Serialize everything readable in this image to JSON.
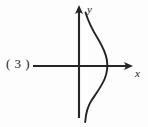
{
  "figure": {
    "number_label": "( 3 )",
    "background_color": "#fdfdfd",
    "ink_color": "#232323",
    "axes": {
      "x_label": "x",
      "y_label": "y",
      "origin": {
        "x": 79,
        "y": 66
      },
      "x_axis": {
        "start_x": 33,
        "end_x": 133,
        "y": 66,
        "arrow": "right"
      },
      "y_axis": {
        "x": 79,
        "start_y": 118,
        "end_y": 6,
        "arrow": "up"
      }
    }
  },
  "chart_data": {
    "type": "line",
    "title": "( 3 )",
    "xlabel": "x",
    "ylabel": "y",
    "grid": false,
    "legend": null,
    "annotations": [],
    "axis_ranges": {
      "xlim": [
        -3,
        4
      ],
      "ylim": [
        -4,
        4
      ]
    },
    "series": [
      {
        "name": "curve",
        "x": [
          0.22,
          0.35,
          0.55,
          0.8,
          1.05,
          1.3,
          1.5,
          1.62,
          1.68,
          1.66,
          1.55,
          1.38,
          1.15,
          0.92,
          0.72,
          0.58,
          0.48,
          0.42
        ],
        "y": [
          3.7,
          3.3,
          2.85,
          2.4,
          1.95,
          1.45,
          1.0,
          0.6,
          0.2,
          -0.2,
          -0.6,
          -1.0,
          -1.45,
          -1.95,
          -2.45,
          -2.95,
          -3.45,
          -3.85
        ]
      }
    ],
    "x_intercept": 1.67,
    "pixel_path": "M 85.5,12.5 C 88.5,22 92.5,30 97.5,38 C 102,45.5 105.5,52 106.8,59.5 C 107.9,66 107.2,72.5 104.8,78.5 C 101.8,86 96.5,93 91.5,100.5 C 87.8,106 86,111 85.2,122"
  }
}
